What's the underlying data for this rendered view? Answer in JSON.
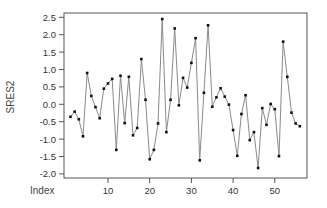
{
  "chart_data": {
    "type": "line",
    "title": "",
    "xlabel": "Index",
    "ylabel": "SRES2",
    "xlim": [
      1,
      56
    ],
    "ylim": [
      -2.0,
      2.5
    ],
    "xticks": [
      10,
      20,
      30,
      40,
      50
    ],
    "yticks": [
      -2.0,
      -1.5,
      -1.0,
      -0.5,
      0.0,
      0.5,
      1.0,
      1.5,
      2.0,
      2.5
    ],
    "ytick_labels": [
      "-2.0",
      "-1.5",
      "-1.0",
      "-0.5",
      "0.0",
      "0.5",
      "1.0",
      "1.5",
      "2.0",
      "2.5"
    ],
    "grid": false,
    "legend": null,
    "markers": true,
    "series": [
      {
        "name": "SRES2",
        "x": [
          1,
          2,
          3,
          4,
          5,
          6,
          7,
          8,
          9,
          10,
          11,
          12,
          13,
          14,
          15,
          16,
          17,
          18,
          19,
          20,
          21,
          22,
          23,
          24,
          25,
          26,
          27,
          28,
          29,
          30,
          31,
          32,
          33,
          34,
          35,
          36,
          37,
          38,
          39,
          40,
          41,
          42,
          43,
          44,
          45,
          46,
          47,
          48,
          49,
          50,
          51,
          52,
          53,
          54,
          55,
          56
        ],
        "values": [
          -0.36,
          -0.21,
          -0.43,
          -0.92,
          0.9,
          0.24,
          -0.08,
          -0.4,
          0.45,
          0.6,
          0.73,
          -1.31,
          0.82,
          -0.54,
          0.79,
          -0.89,
          -0.68,
          1.3,
          0.13,
          -1.58,
          -1.31,
          -0.55,
          2.45,
          -0.8,
          0.13,
          2.18,
          -0.03,
          0.76,
          0.48,
          1.19,
          1.9,
          -1.61,
          0.33,
          2.27,
          -0.07,
          0.2,
          0.46,
          0.22,
          -0.01,
          -0.74,
          -1.48,
          -0.28,
          0.26,
          -1.03,
          -0.8,
          -1.83,
          -0.11,
          -0.59,
          0.01,
          -0.14,
          -1.49,
          1.8,
          0.79,
          -0.24,
          -0.55,
          -0.63
        ]
      }
    ]
  },
  "colors": {
    "line": "#8a8a8a",
    "marker": "#111111",
    "frame": "#555555",
    "text": "#333333"
  }
}
